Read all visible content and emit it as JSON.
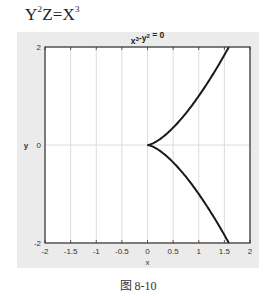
{
  "equation": {
    "base1": "Y",
    "exp1": "2",
    "mid": "Z=X",
    "exp2": "3"
  },
  "caption": "图 8-10",
  "chart_data": {
    "type": "line",
    "title_parts": {
      "a": "x",
      "a_exp": "3",
      "b": "-y",
      "b_exp": "2",
      "c": " = 0"
    },
    "xlabel": "x",
    "ylabel": "y",
    "xlim": [
      -2,
      2
    ],
    "ylim": [
      -2,
      2
    ],
    "xticks": [
      "-2",
      "-1.5",
      "-1",
      "-0.5",
      "0",
      "0.5",
      "1",
      "1.5",
      "2"
    ],
    "yticks": [
      "-2",
      "0",
      "2"
    ],
    "grid": true,
    "series": [
      {
        "name": "upper branch",
        "x": [
          0,
          0.25,
          0.5,
          0.75,
          1.0,
          1.25,
          1.5,
          1.587
        ],
        "y": [
          0,
          0.125,
          0.354,
          0.65,
          1.0,
          1.398,
          1.837,
          2.0
        ]
      },
      {
        "name": "lower branch",
        "x": [
          0,
          0.25,
          0.5,
          0.75,
          1.0,
          1.25,
          1.5,
          1.587
        ],
        "y": [
          0,
          -0.125,
          -0.354,
          -0.65,
          -1.0,
          -1.398,
          -1.837,
          -2.0
        ]
      }
    ],
    "colors": {
      "line": "#1a1a1a",
      "grid": "#dcdcdc",
      "panel": "#ebebeb",
      "axes_bg": "#ffffff"
    }
  }
}
